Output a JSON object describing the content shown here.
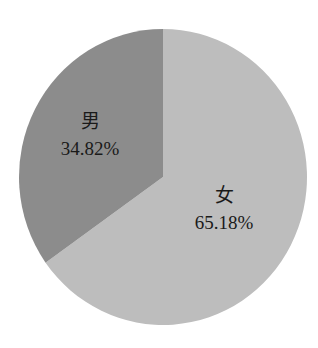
{
  "chart_data": {
    "type": "pie",
    "title": "",
    "categories": [
      "男",
      "女"
    ],
    "values": [
      34.82,
      65.18
    ],
    "labels": [
      "34.82%",
      "65.18%"
    ],
    "colors": [
      "#8c8c8c",
      "#bdbdbd"
    ],
    "start_angle": "12 o'clock, male slice counter-clockwise",
    "legend": "none (inline data labels)"
  },
  "slices": [
    {
      "name": "男",
      "pct_label": "34.82%",
      "value": 34.82,
      "color": "#8c8c8c"
    },
    {
      "name": "女",
      "pct_label": "65.18%",
      "value": 65.18,
      "color": "#bdbdbd"
    }
  ],
  "background": "#ffffff"
}
